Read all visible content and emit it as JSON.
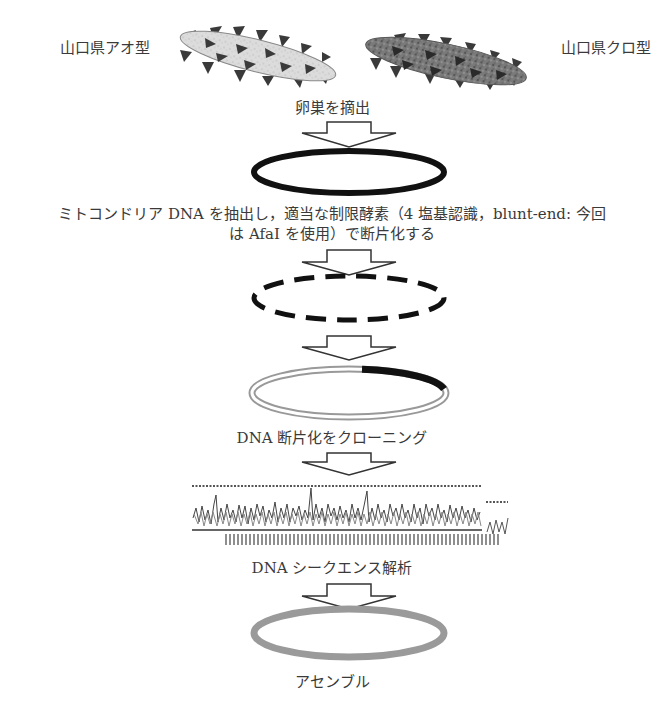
{
  "diagram": {
    "type": "flowchart",
    "direction": "top-to-bottom",
    "sources": [
      {
        "label": "山口県アオ型",
        "color": "#d8d8d8"
      },
      {
        "label": "山口県クロ型",
        "color": "#707070"
      }
    ],
    "steps": [
      {
        "id": "ovary",
        "label": "卵巣を摘出",
        "shape": "ellipse-solid-black"
      },
      {
        "id": "extract",
        "label_line1": "ミトコンドリア DNA を抽出し，適当な制限酵素（4 塩基認識，blunt-end: 今回",
        "label_line2": "は AfaI を使用）で断片化する",
        "shape": "ellipse-dashed-black"
      },
      {
        "id": "clone",
        "label": "",
        "shape": "ellipse-double-with-insert"
      },
      {
        "id": "cloning",
        "label": "DNA 断片化をクローニング",
        "shape": "sequence-chromatogram"
      },
      {
        "id": "sequencing",
        "label": "DNA シークエンス解析",
        "shape": "ellipse-gray"
      },
      {
        "id": "assembly",
        "label": "アセンブル"
      }
    ],
    "colors": {
      "arrow_stroke": "#333333",
      "black_ring": "#111111",
      "gray_ring": "#9a9a9a"
    }
  }
}
